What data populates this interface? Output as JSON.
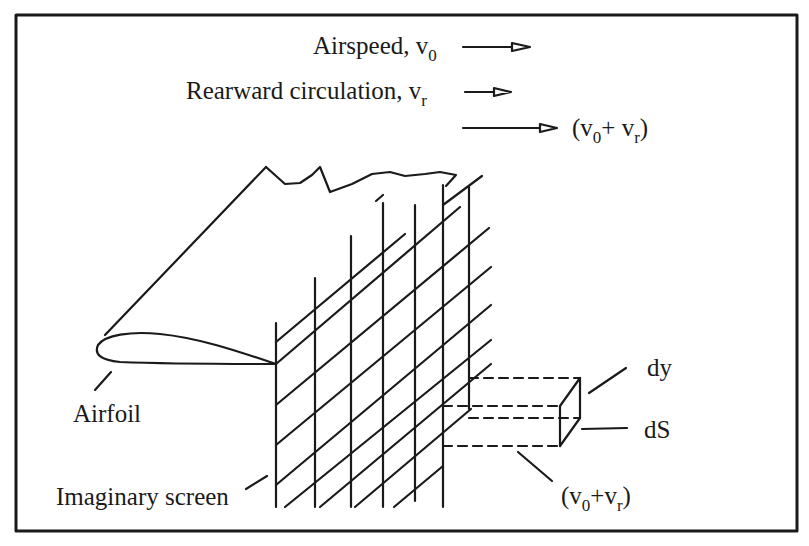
{
  "diagram": {
    "title": "",
    "colors": {
      "ink": "#1a1a1a",
      "background": "#ffffff"
    },
    "legend": [
      {
        "label": "Airspeed, v",
        "sub": "0",
        "arrow": "short-arrow"
      },
      {
        "label": "Rearward circulation, v",
        "sub": "r",
        "arrow": "shorter-arrow"
      },
      {
        "label_pre": "(v",
        "sub0": "0",
        "label_mid": "+ v",
        "subr": "r",
        "label_post": ")",
        "arrow": "long-arrow"
      }
    ],
    "labels": {
      "airfoil": "Airfoil",
      "screen": "Imaginary screen",
      "dy": "dy",
      "dS": "dS",
      "bottom_sum": {
        "pre": "(v",
        "sub0": "0",
        "mid": "+v",
        "subr": "r",
        "post": ")"
      }
    },
    "parts": [
      "airfoil",
      "imaginary-screen-grid",
      "volume-element-box"
    ]
  }
}
